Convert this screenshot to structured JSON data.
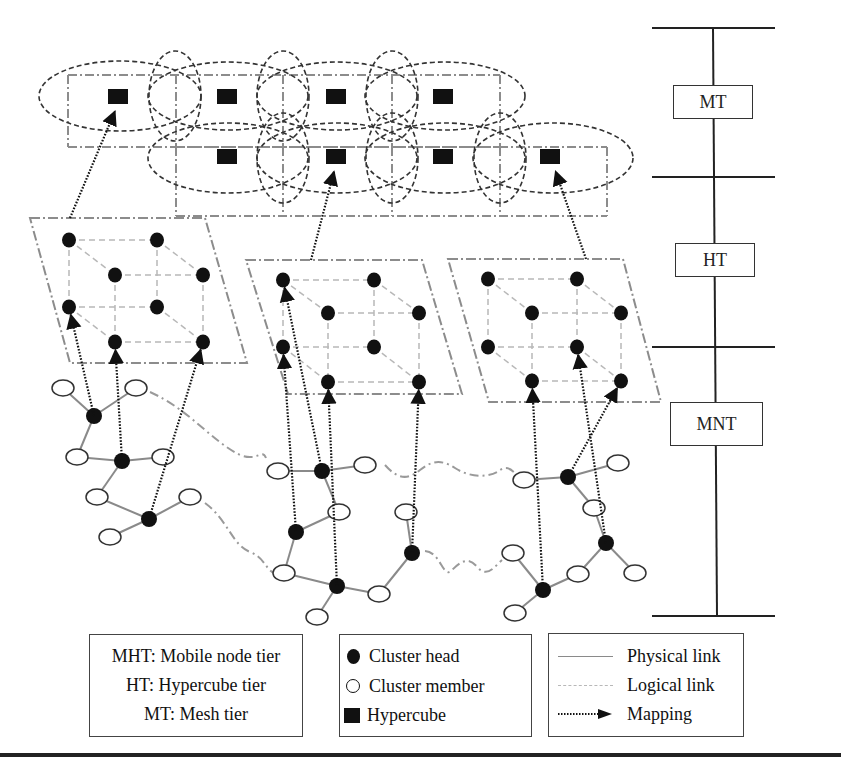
{
  "colors": {
    "ink": "#111111",
    "physical_link": "#8a8a8a",
    "logical_link": "#b8b8b8",
    "mesh_frame": "#8c8c8c",
    "cluster_boundary": "#9a9a9a",
    "ladder": "#222222"
  },
  "tiers": {
    "labels": [
      {
        "id": "mt",
        "label": "MT",
        "x": 673,
        "y": 85,
        "w": 80,
        "h": 34
      },
      {
        "id": "ht",
        "label": "HT",
        "x": 675,
        "y": 243,
        "w": 80,
        "h": 34
      },
      {
        "id": "mnt",
        "label": "MNT",
        "x": 670,
        "y": 402,
        "w": 93,
        "h": 44
      }
    ],
    "bars_y": [
      28,
      177,
      347,
      616
    ],
    "bar_x1": 652,
    "bar_x2": 775
  },
  "mesh_tier": {
    "name": "Mesh tier",
    "rows": [
      {
        "y1": 75,
        "y2": 147,
        "xs": [
          68,
          176,
          283,
          392,
          500
        ]
      },
      {
        "y1": 147,
        "y2": 216,
        "xs": [
          176,
          283,
          392,
          500,
          607
        ]
      }
    ],
    "hypercubes": [
      {
        "x": 118,
        "y": 96
      },
      {
        "x": 227,
        "y": 96
      },
      {
        "x": 336,
        "y": 96
      },
      {
        "x": 443,
        "y": 96
      },
      {
        "x": 227,
        "y": 156
      },
      {
        "x": 336,
        "y": 156
      },
      {
        "x": 443,
        "y": 156
      },
      {
        "x": 550,
        "y": 156
      }
    ],
    "ellipses": [
      {
        "cx": 120,
        "cy": 96,
        "rx": 81,
        "ry": 35
      },
      {
        "cx": 175,
        "cy": 96,
        "rx": 26,
        "ry": 45
      },
      {
        "cx": 228,
        "cy": 96,
        "rx": 80,
        "ry": 34
      },
      {
        "cx": 283,
        "cy": 96,
        "rx": 26,
        "ry": 45
      },
      {
        "cx": 337,
        "cy": 96,
        "rx": 80,
        "ry": 34
      },
      {
        "cx": 392,
        "cy": 96,
        "rx": 26,
        "ry": 45
      },
      {
        "cx": 445,
        "cy": 96,
        "rx": 80,
        "ry": 34
      },
      {
        "cx": 228,
        "cy": 158,
        "rx": 80,
        "ry": 35
      },
      {
        "cx": 283,
        "cy": 158,
        "rx": 26,
        "ry": 45
      },
      {
        "cx": 337,
        "cy": 158,
        "rx": 80,
        "ry": 35
      },
      {
        "cx": 392,
        "cy": 158,
        "rx": 26,
        "ry": 45
      },
      {
        "cx": 445,
        "cy": 158,
        "rx": 80,
        "ry": 35
      },
      {
        "cx": 500,
        "cy": 158,
        "rx": 26,
        "ry": 45
      },
      {
        "cx": 553,
        "cy": 158,
        "rx": 80,
        "ry": 35
      }
    ]
  },
  "hypercube_tier": {
    "name": "Hypercube tier",
    "frames": [
      {
        "points": [
          [
            30,
            218
          ],
          [
            205,
            218
          ],
          [
            247,
            363
          ],
          [
            70,
            363
          ]
        ],
        "nodes": [
          [
            69,
            240
          ],
          [
            157,
            240
          ],
          [
            115,
            275
          ],
          [
            203,
            275
          ],
          [
            69,
            307
          ],
          [
            157,
            307
          ],
          [
            115,
            342
          ],
          [
            203,
            342
          ]
        ]
      },
      {
        "points": [
          [
            246,
            260
          ],
          [
            422,
            260
          ],
          [
            462,
            394
          ],
          [
            288,
            394
          ]
        ],
        "nodes": [
          [
            283,
            280
          ],
          [
            374,
            280
          ],
          [
            328,
            313
          ],
          [
            419,
            313
          ],
          [
            283,
            347
          ],
          [
            374,
            347
          ],
          [
            328,
            382
          ],
          [
            419,
            382
          ]
        ]
      },
      {
        "points": [
          [
            448,
            259
          ],
          [
            623,
            259
          ],
          [
            661,
            402
          ],
          [
            489,
            402
          ]
        ],
        "nodes": [
          [
            488,
            279
          ],
          [
            577,
            279
          ],
          [
            532,
            313
          ],
          [
            621,
            313
          ],
          [
            488,
            347
          ],
          [
            577,
            347
          ],
          [
            532,
            381
          ],
          [
            621,
            381
          ]
        ]
      }
    ],
    "cube_edges": [
      [
        0,
        1
      ],
      [
        0,
        2
      ],
      [
        1,
        3
      ],
      [
        2,
        3
      ],
      [
        4,
        5
      ],
      [
        4,
        6
      ],
      [
        5,
        7
      ],
      [
        6,
        7
      ],
      [
        0,
        4
      ],
      [
        1,
        5
      ],
      [
        2,
        6
      ],
      [
        3,
        7
      ]
    ]
  },
  "mobile_node_tier": {
    "name": "Mobile node tier",
    "heads": [
      [
        94,
        416
      ],
      [
        122,
        461
      ],
      [
        149,
        519
      ],
      [
        322,
        471
      ],
      [
        296,
        532
      ],
      [
        337,
        586
      ],
      [
        412,
        553
      ],
      [
        568,
        477
      ],
      [
        606,
        543
      ],
      [
        543,
        590
      ]
    ],
    "members": [
      [
        63,
        388
      ],
      [
        136,
        388
      ],
      [
        77,
        457
      ],
      [
        163,
        457
      ],
      [
        97,
        497
      ],
      [
        190,
        497
      ],
      [
        110,
        537
      ],
      [
        278,
        471
      ],
      [
        365,
        465
      ],
      [
        339,
        512
      ],
      [
        406,
        512
      ],
      [
        284,
        573
      ],
      [
        379,
        594
      ],
      [
        317,
        617
      ],
      [
        524,
        480
      ],
      [
        618,
        463
      ],
      [
        594,
        508
      ],
      [
        513,
        553
      ],
      [
        578,
        574
      ],
      [
        635,
        573
      ],
      [
        515,
        613
      ]
    ],
    "physical_links": [
      [
        [
          63,
          388
        ],
        [
          94,
          416
        ]
      ],
      [
        [
          136,
          388
        ],
        [
          94,
          416
        ]
      ],
      [
        [
          94,
          416
        ],
        [
          77,
          457
        ]
      ],
      [
        [
          77,
          457
        ],
        [
          122,
          461
        ]
      ],
      [
        [
          122,
          461
        ],
        [
          163,
          457
        ]
      ],
      [
        [
          122,
          461
        ],
        [
          97,
          497
        ]
      ],
      [
        [
          97,
          497
        ],
        [
          149,
          519
        ]
      ],
      [
        [
          149,
          519
        ],
        [
          190,
          497
        ]
      ],
      [
        [
          149,
          519
        ],
        [
          110,
          537
        ]
      ],
      [
        [
          278,
          471
        ],
        [
          322,
          471
        ]
      ],
      [
        [
          322,
          471
        ],
        [
          365,
          465
        ]
      ],
      [
        [
          322,
          471
        ],
        [
          339,
          512
        ]
      ],
      [
        [
          339,
          512
        ],
        [
          296,
          532
        ]
      ],
      [
        [
          296,
          532
        ],
        [
          284,
          573
        ]
      ],
      [
        [
          284,
          573
        ],
        [
          337,
          586
        ]
      ],
      [
        [
          337,
          586
        ],
        [
          379,
          594
        ]
      ],
      [
        [
          337,
          586
        ],
        [
          317,
          617
        ]
      ],
      [
        [
          379,
          594
        ],
        [
          412,
          553
        ]
      ],
      [
        [
          412,
          553
        ],
        [
          406,
          512
        ]
      ],
      [
        [
          524,
          480
        ],
        [
          568,
          477
        ]
      ],
      [
        [
          568,
          477
        ],
        [
          618,
          463
        ]
      ],
      [
        [
          568,
          477
        ],
        [
          594,
          508
        ]
      ],
      [
        [
          594,
          508
        ],
        [
          606,
          543
        ]
      ],
      [
        [
          606,
          543
        ],
        [
          635,
          573
        ]
      ],
      [
        [
          606,
          543
        ],
        [
          578,
          574
        ]
      ],
      [
        [
          578,
          574
        ],
        [
          543,
          590
        ]
      ],
      [
        [
          543,
          590
        ],
        [
          513,
          553
        ]
      ],
      [
        [
          543,
          590
        ],
        [
          515,
          613
        ]
      ]
    ],
    "boundary_paths": [
      "M150,392 C190,410 210,440 240,455 C258,462 262,448 266,458",
      "M205,503 C228,520 232,545 250,552 C270,560 262,575 290,578",
      "M385,465 C400,482 410,478 420,470 C430,462 440,458 455,468 C470,478 490,478 500,470 C508,465 512,470 520,478",
      "M425,551 C440,552 442,575 450,572 C460,562 468,555 478,568 C488,578 495,566 502,560"
    ]
  },
  "mappings": [
    {
      "from": [
        94,
        416
      ],
      "to": [
        69,
        307
      ]
    },
    {
      "from": [
        122,
        461
      ],
      "to": [
        115,
        342
      ]
    },
    {
      "from": [
        149,
        519
      ],
      "to": [
        203,
        342
      ]
    },
    {
      "from": [
        322,
        471
      ],
      "to": [
        283,
        280
      ]
    },
    {
      "from": [
        296,
        532
      ],
      "to": [
        283,
        347
      ]
    },
    {
      "from": [
        337,
        586
      ],
      "to": [
        328,
        382
      ]
    },
    {
      "from": [
        412,
        553
      ],
      "to": [
        419,
        382
      ]
    },
    {
      "from": [
        568,
        477
      ],
      "to": [
        621,
        381
      ]
    },
    {
      "from": [
        543,
        590
      ],
      "to": [
        532,
        381
      ]
    },
    {
      "from": [
        606,
        543
      ],
      "to": [
        577,
        347
      ]
    },
    {
      "from": [
        70,
        218
      ],
      "to": [
        118,
        104
      ]
    },
    {
      "from": [
        311,
        260
      ],
      "to": [
        336,
        164
      ]
    },
    {
      "from": [
        586,
        259
      ],
      "to": [
        553,
        164
      ]
    }
  ],
  "legend": {
    "tiers_box": {
      "lines": [
        "MHT: Mobile node tier",
        "HT: Hypercube tier",
        "MT: Mesh tier"
      ]
    },
    "nodes_box": {
      "items": [
        {
          "symbol": "filled-circle",
          "label": "Cluster head"
        },
        {
          "symbol": "open-circle",
          "label": "Cluster member"
        },
        {
          "symbol": "filled-square",
          "label": "Hypercube"
        }
      ]
    },
    "links_box": {
      "items": [
        {
          "symbol": "solid-line",
          "label": "Physical link"
        },
        {
          "symbol": "dashed-line",
          "label": "Logical link"
        },
        {
          "symbol": "dotted-arrow",
          "label": "Mapping"
        }
      ]
    }
  }
}
